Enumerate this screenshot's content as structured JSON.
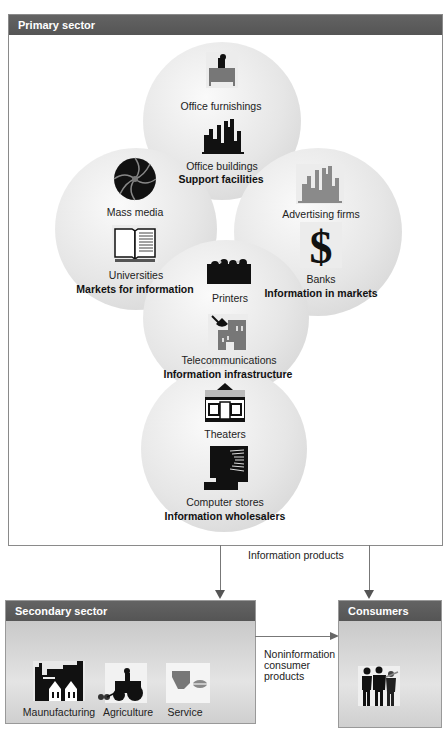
{
  "primary_sector": {
    "title": "Primary sector",
    "groups": [
      {
        "name": "support-facilities",
        "heading": "Support facilities",
        "items": [
          {
            "label": "Office furnishings",
            "icon": "desk-person-icon"
          },
          {
            "label": "Office buildings",
            "icon": "city-buildings-icon"
          }
        ]
      },
      {
        "name": "markets-for-information",
        "heading": "Markets for information",
        "items": [
          {
            "label": "Mass media",
            "icon": "camera-aperture-icon"
          },
          {
            "label": "Universities",
            "icon": "open-book-icon"
          }
        ]
      },
      {
        "name": "information-in-markets",
        "heading": "Information in markets",
        "items": [
          {
            "label": "Advertising firms",
            "icon": "gray-buildings-icon"
          },
          {
            "label": "Banks",
            "icon": "dollar-sign-icon"
          }
        ]
      },
      {
        "name": "information-infrastructure",
        "heading": "Information infrastructure",
        "items": [
          {
            "label": "Printers",
            "icon": "people-row-icon"
          },
          {
            "label": "Telecommunications",
            "icon": "satellite-building-icon"
          }
        ]
      },
      {
        "name": "information-wholesalers",
        "heading": "Information wholesalers",
        "items": [
          {
            "label": "Theaters",
            "icon": "theater-storefront-icon"
          },
          {
            "label": "Computer stores",
            "icon": "computer-icon"
          }
        ]
      }
    ]
  },
  "flows": {
    "information_products": "Information products",
    "noninformation_line1": "Noninformation",
    "noninformation_line2": "consumer",
    "noninformation_line3": "products"
  },
  "secondary_sector": {
    "title": "Secondary sector",
    "items": [
      {
        "label": "Maunufacturing",
        "icon": "factory-icon"
      },
      {
        "label": "Agriculture",
        "icon": "tractor-icon"
      },
      {
        "label": "Service",
        "icon": "service-icon"
      }
    ]
  },
  "consumers": {
    "title": "Consumers",
    "icon": "people-silhouettes-icon"
  },
  "colors": {
    "header_bg": "#5a5a5a",
    "circle_fill": "#e2e2e2",
    "icon_dark": "#111111",
    "icon_gray": "#7a7a7a"
  }
}
